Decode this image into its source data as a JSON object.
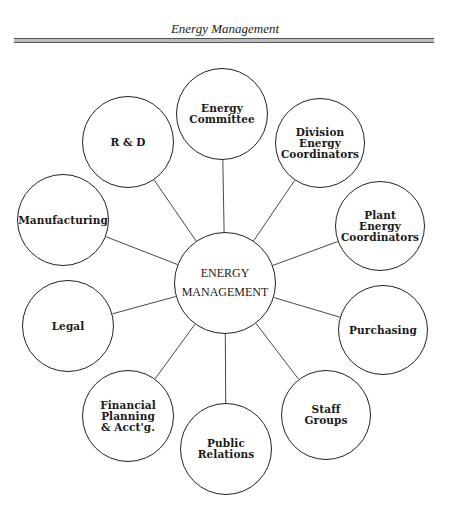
{
  "header": {
    "title": "Energy Management"
  },
  "diagram": {
    "center": {
      "label": "ENERGY\nMANAGEMENT",
      "cx": 225,
      "cy": 283,
      "r": 51
    },
    "nodes": [
      {
        "id": "energy-committee",
        "label": "Energy\nCommittee",
        "cx": 222,
        "cy": 114,
        "r": 46
      },
      {
        "id": "division-energy-coordinators",
        "label": "Division\nEnergy\nCoordinators",
        "cx": 320,
        "cy": 143,
        "r": 45
      },
      {
        "id": "plant-energy-coordinators",
        "label": "Plant\nEnergy\nCoordinators",
        "cx": 380,
        "cy": 226,
        "r": 45
      },
      {
        "id": "purchasing",
        "label": "Purchasing",
        "cx": 383,
        "cy": 330,
        "r": 45
      },
      {
        "id": "staff-groups",
        "label": "Staff\nGroups",
        "cx": 326,
        "cy": 415,
        "r": 45
      },
      {
        "id": "public-relations",
        "label": "Public\nRelations",
        "cx": 226,
        "cy": 449,
        "r": 46
      },
      {
        "id": "financial-planning",
        "label": "Financial\nPlanning\n& Acct'g.",
        "cx": 128,
        "cy": 416,
        "r": 46
      },
      {
        "id": "legal",
        "label": "Legal",
        "cx": 68,
        "cy": 326,
        "r": 46
      },
      {
        "id": "manufacturing",
        "label": "Manufacturing",
        "cx": 63,
        "cy": 220,
        "r": 46
      },
      {
        "id": "r-and-d",
        "label": "R & D",
        "cx": 128,
        "cy": 142,
        "r": 46
      }
    ]
  }
}
